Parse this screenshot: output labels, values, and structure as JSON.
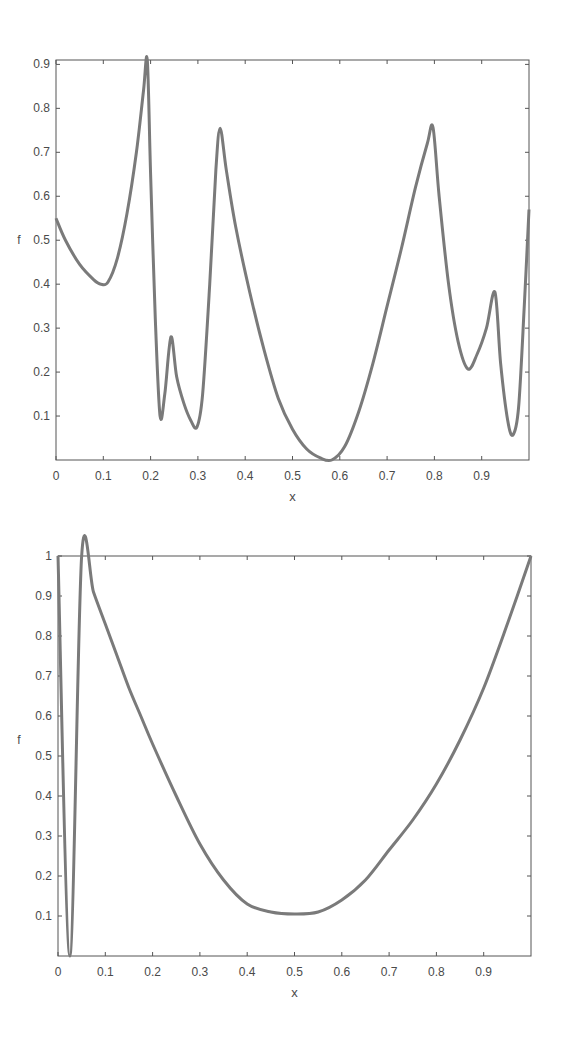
{
  "chart_data": [
    {
      "type": "line",
      "title": "",
      "xlabel": "x",
      "ylabel": "f",
      "xlim": [
        0,
        1
      ],
      "ylim": [
        0,
        0.91
      ],
      "grid": false,
      "legend": null,
      "xticks": [
        "0",
        "0.1",
        "0.2",
        "0.3",
        "0.4",
        "0.5",
        "0.6",
        "0.7",
        "0.8",
        "0.9"
      ],
      "yticks": [
        "0.1",
        "0.2",
        "0.3",
        "0.4",
        "0.5",
        "0.6",
        "0.7",
        "0.8",
        "0.9"
      ],
      "line_color": "#7a7a7a",
      "series": [
        {
          "name": "f",
          "x": [
            0.0,
            0.02,
            0.05,
            0.08,
            0.095,
            0.11,
            0.13,
            0.15,
            0.17,
            0.185,
            0.193,
            0.2,
            0.21,
            0.22,
            0.23,
            0.243,
            0.255,
            0.27,
            0.285,
            0.298,
            0.31,
            0.325,
            0.338,
            0.347,
            0.36,
            0.38,
            0.41,
            0.44,
            0.47,
            0.5,
            0.53,
            0.56,
            0.583,
            0.61,
            0.64,
            0.67,
            0.7,
            0.73,
            0.76,
            0.785,
            0.797,
            0.81,
            0.83,
            0.85,
            0.871,
            0.89,
            0.91,
            0.928,
            0.94,
            0.955,
            0.966,
            0.978,
            0.99,
            1.0
          ],
          "y": [
            0.55,
            0.5,
            0.445,
            0.41,
            0.4,
            0.405,
            0.46,
            0.56,
            0.7,
            0.84,
            0.91,
            0.65,
            0.32,
            0.1,
            0.15,
            0.28,
            0.19,
            0.13,
            0.09,
            0.075,
            0.15,
            0.4,
            0.66,
            0.755,
            0.66,
            0.53,
            0.38,
            0.25,
            0.14,
            0.07,
            0.025,
            0.004,
            0.0,
            0.03,
            0.11,
            0.22,
            0.35,
            0.48,
            0.62,
            0.72,
            0.757,
            0.6,
            0.4,
            0.27,
            0.207,
            0.24,
            0.3,
            0.382,
            0.22,
            0.09,
            0.057,
            0.12,
            0.35,
            0.57
          ]
        }
      ]
    },
    {
      "type": "line",
      "title": "",
      "xlabel": "x",
      "ylabel": "f",
      "xlim": [
        0,
        1
      ],
      "ylim": [
        0,
        1
      ],
      "grid": false,
      "legend": null,
      "xticks": [
        "0",
        "0.1",
        "0.2",
        "0.3",
        "0.4",
        "0.5",
        "0.6",
        "0.7",
        "0.8",
        "0.9"
      ],
      "yticks": [
        "0.1",
        "0.2",
        "0.3",
        "0.4",
        "0.5",
        "0.6",
        "0.7",
        "0.8",
        "0.9",
        "1"
      ],
      "line_color": "#7a7a7a",
      "series": [
        {
          "name": "f",
          "x": [
            0.0,
            0.025,
            0.05,
            0.075,
            0.1,
            0.125,
            0.15,
            0.175,
            0.2,
            0.25,
            0.3,
            0.35,
            0.4,
            0.45,
            0.5,
            0.55,
            0.6,
            0.65,
            0.7,
            0.75,
            0.8,
            0.85,
            0.9,
            0.95,
            1.0
          ],
          "y": [
            1.0,
            0.0,
            1.0,
            0.91,
            0.83,
            0.75,
            0.67,
            0.6,
            0.53,
            0.4,
            0.28,
            0.19,
            0.13,
            0.11,
            0.105,
            0.11,
            0.14,
            0.19,
            0.265,
            0.34,
            0.43,
            0.54,
            0.67,
            0.83,
            1.0
          ]
        }
      ]
    }
  ],
  "charts": [
    {
      "xlabel": "x",
      "ylabel": "f"
    },
    {
      "xlabel": "x",
      "ylabel": "f"
    }
  ]
}
